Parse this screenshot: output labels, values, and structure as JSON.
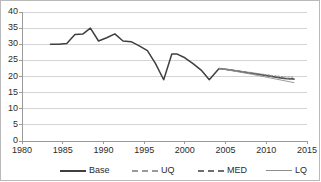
{
  "chart_data": {
    "type": "line",
    "title": "",
    "xlabel": "",
    "ylabel": "",
    "xlim": [
      1980,
      2015
    ],
    "ylim": [
      0,
      40
    ],
    "xticks": [
      1980,
      1985,
      1990,
      1995,
      2000,
      2005,
      2010,
      2015
    ],
    "yticks": [
      0,
      5,
      10,
      15,
      20,
      25,
      30,
      35,
      40
    ],
    "grid": "horizontal",
    "legend_position": "bottom",
    "series": [
      {
        "name": "Base",
        "style": "solid",
        "color": "#3f3f3f",
        "x": [
          1983.5,
          1984.5,
          1985.5,
          1986.5,
          1987.5,
          1988.4,
          1989.4,
          1990.4,
          1991.4,
          1992.4,
          1993.4,
          1994.4,
          1995.4,
          1996.4,
          1997.4,
          1998.4,
          1999.0,
          2000.0,
          2001.0,
          2002.0,
          2003.0,
          2004.2,
          2005.2,
          2006.2,
          2007.2,
          2008.2,
          2009.2,
          2010.2,
          2011.2,
          2012.2,
          2013.4
        ],
        "values": [
          30.0,
          30.0,
          30.2,
          33.0,
          33.2,
          35.0,
          31.0,
          32.0,
          33.2,
          31.0,
          30.8,
          29.5,
          28.0,
          24.0,
          19.0,
          27.0,
          27.0,
          25.8,
          24.0,
          22.0,
          19.0,
          22.5,
          22.2,
          21.8,
          21.4,
          21.0,
          20.6,
          20.2,
          19.8,
          19.4,
          19.2
        ]
      },
      {
        "name": "UQ",
        "style": "dotted",
        "color": "#9a9a9a",
        "x": [
          2004.2,
          2006.2,
          2008.2,
          2010.2,
          2012.2,
          2013.4
        ],
        "values": [
          22.5,
          21.9,
          21.2,
          20.5,
          19.9,
          19.8
        ]
      },
      {
        "name": "MED",
        "style": "dashed",
        "color": "#6e6e6e",
        "x": [
          2004.2,
          2006.2,
          2008.2,
          2010.2,
          2012.2,
          2013.4
        ],
        "values": [
          22.5,
          21.8,
          21.0,
          20.2,
          19.5,
          19.1
        ]
      },
      {
        "name": "LQ",
        "style": "solid-thin",
        "color": "#8e8e8e",
        "x": [
          2004.2,
          2006.2,
          2008.2,
          2010.2,
          2012.2,
          2013.4
        ],
        "values": [
          22.5,
          21.6,
          20.7,
          19.7,
          18.7,
          18.1
        ]
      }
    ]
  },
  "axes": {
    "y_labels": [
      "0",
      "5",
      "10",
      "15",
      "20",
      "25",
      "30",
      "35",
      "40"
    ],
    "x_labels": [
      "1980",
      "1985",
      "1990",
      "1995",
      "2000",
      "2005",
      "2010",
      "2015"
    ]
  },
  "legend": {
    "items": [
      {
        "label": "Base"
      },
      {
        "label": "UQ"
      },
      {
        "label": "MED"
      },
      {
        "label": "LQ"
      }
    ]
  },
  "colors": {
    "base": "#3f3f3f",
    "uq": "#9a9a9a",
    "med": "#6e6e6e",
    "lq": "#8e8e8e",
    "grid": "#d4d4d4",
    "axis": "#9b9b9b",
    "border": "#b9b9b9",
    "text": "#2b2b2b"
  }
}
